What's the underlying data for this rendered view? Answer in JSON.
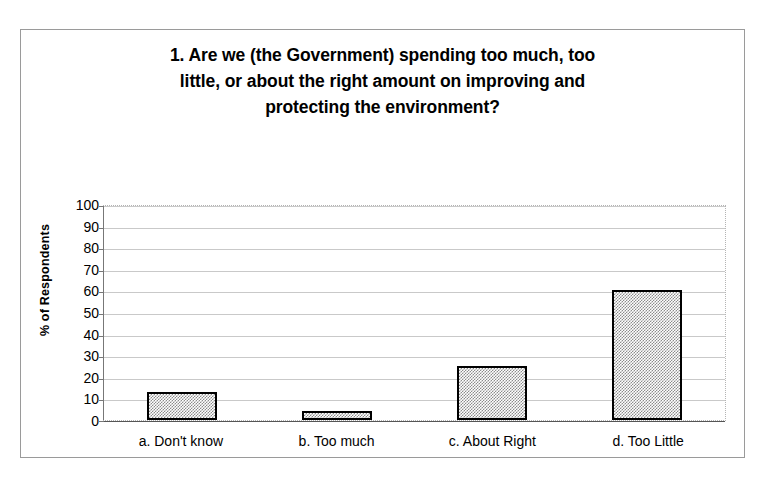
{
  "chart_data": {
    "type": "bar",
    "title": "1. Are we (the Government) spending too much, too little, or about the right amount on improving and protecting the environment?",
    "title_lines": [
      "1. Are we (the Government) spending too much, too",
      "little, or about the right amount on improving and",
      "protecting the environment?"
    ],
    "categories": [
      "a. Don't know",
      "b. Too much",
      "c. About Right",
      "d. Too Little"
    ],
    "values": [
      13,
      4,
      25,
      60
    ],
    "xlabel": "",
    "ylabel": "% of Respondents",
    "ylim": [
      0,
      100
    ],
    "ytick_step": 10,
    "yticks": [
      100,
      90,
      80,
      70,
      60,
      50,
      40,
      30,
      20,
      10,
      0
    ],
    "grid": true,
    "legend": false,
    "bar_fill": "#8c8c8c",
    "bar_border": "#000000",
    "gridline_color": "#c9c9c9",
    "plot_border_color": "#b4b4b4",
    "frame_color": "#9a9a9a",
    "background": "#ffffff"
  }
}
